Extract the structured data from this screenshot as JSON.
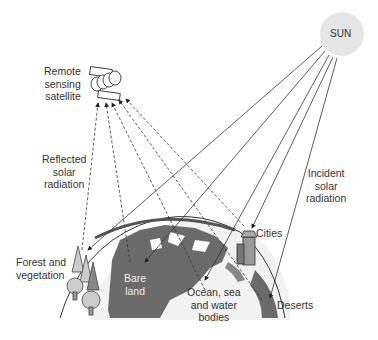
{
  "diagram": {
    "nodes": {
      "sun": {
        "label": "SUN",
        "color": "#e6e6e6"
      },
      "satellite": {
        "label_lines": [
          "Remote",
          "sensing",
          "satellite"
        ]
      },
      "reflected": {
        "label_lines": [
          "Reflected",
          "solar",
          "radiation"
        ]
      },
      "incident": {
        "label_lines": [
          "Incident",
          "solar",
          "radiation"
        ]
      },
      "forest": {
        "label_lines": [
          "Forest and",
          "vegetation"
        ]
      },
      "bare_land": {
        "label_lines": [
          "Bare",
          "land"
        ]
      },
      "ocean": {
        "label_lines": [
          "Ocean, sea",
          "and water",
          "bodies"
        ]
      },
      "cities": {
        "label": "Cities"
      },
      "deserts": {
        "label": "Deserts"
      }
    },
    "colors": {
      "land": "#6b6b6b",
      "ocean": "#f2f2f2",
      "line": "#333333",
      "sun": "#e6e6e6"
    }
  }
}
